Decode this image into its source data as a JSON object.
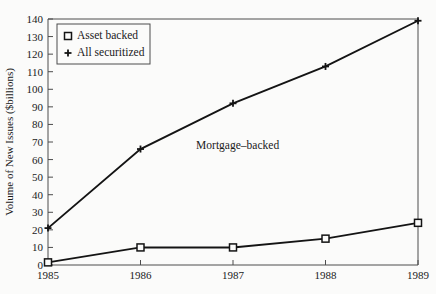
{
  "chart_data": {
    "type": "line",
    "title": "",
    "xlabel": "",
    "ylabel": "Volume of New Issues ($billions)",
    "x": [
      1985,
      1986,
      1987,
      1988,
      1989
    ],
    "xtick_labels": [
      "1985",
      "1986",
      "1987",
      "1988",
      "1989"
    ],
    "ytick_labels": [
      "0",
      "10",
      "20",
      "30",
      "40",
      "50",
      "60",
      "70",
      "80",
      "90",
      "100",
      "110",
      "120",
      "130",
      "140"
    ],
    "ytick_values": [
      0,
      10,
      20,
      30,
      40,
      50,
      60,
      70,
      80,
      90,
      100,
      110,
      120,
      130,
      140
    ],
    "xlim": [
      1985,
      1989
    ],
    "ylim": [
      0,
      140
    ],
    "grid": false,
    "legend_position": "upper-left",
    "series": [
      {
        "name": "Asset backed",
        "marker": "open-square",
        "values": [
          1.5,
          10,
          10,
          15,
          24
        ]
      },
      {
        "name": "All securitized",
        "marker": "plus",
        "values": [
          21,
          66,
          92,
          113,
          139
        ]
      }
    ],
    "annotations": [
      {
        "text": "Mortgage–backed",
        "x": 1987.05,
        "y": 66
      }
    ]
  },
  "legend": {
    "items": [
      {
        "label": "Asset backed",
        "marker": "open-square"
      },
      {
        "label": "All securitized",
        "marker": "plus"
      }
    ]
  },
  "colors": {
    "background": "#fbfbfa",
    "line": "#141414",
    "frame": "#4c4c4c",
    "text": "#1a1a1a"
  }
}
